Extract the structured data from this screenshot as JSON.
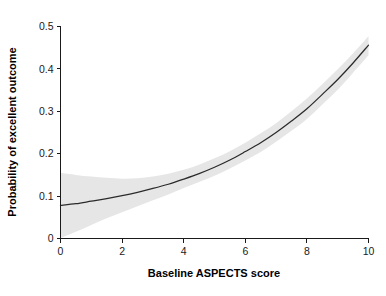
{
  "chart_data": {
    "type": "line",
    "title": "",
    "subtitle": "",
    "xlabel": "Baseline ASPECTS score",
    "ylabel": "Probability of excellent outcome",
    "xlim": [
      0,
      10
    ],
    "ylim": [
      0,
      0.5
    ],
    "xticks": [
      0,
      2,
      4,
      6,
      8,
      10
    ],
    "xtick_labels": [
      "0",
      "2",
      "4",
      "6",
      "8",
      "10"
    ],
    "yticks": [
      0,
      0.1,
      0.2,
      0.3,
      0.4,
      0.5
    ],
    "ytick_labels": [
      "0",
      "0.1",
      "0.2",
      "0.3",
      "0.4",
      "0.5"
    ],
    "grid": false,
    "legend": false,
    "legend_position": "none",
    "annotations": [],
    "x": [
      0,
      0.5,
      1,
      1.5,
      2,
      2.5,
      3,
      3.5,
      4,
      4.5,
      5,
      5.5,
      6,
      6.5,
      7,
      7.5,
      8,
      8.5,
      9,
      9.5,
      10
    ],
    "series": [
      {
        "name": "Predicted probability",
        "type": "line",
        "color": "#2b2b2b",
        "values": [
          0.078,
          0.082,
          0.088,
          0.094,
          0.101,
          0.109,
          0.118,
          0.128,
          0.14,
          0.153,
          0.168,
          0.185,
          0.205,
          0.226,
          0.25,
          0.277,
          0.306,
          0.34,
          0.375,
          0.414,
          0.456
        ]
      },
      {
        "name": "95% confidence interval (upper)",
        "type": "band-upper",
        "color": "#e6e6e6",
        "values": [
          0.155,
          0.15,
          0.146,
          0.143,
          0.141,
          0.142,
          0.146,
          0.153,
          0.162,
          0.174,
          0.189,
          0.206,
          0.226,
          0.248,
          0.272,
          0.3,
          0.33,
          0.364,
          0.399,
          0.437,
          0.477
        ]
      },
      {
        "name": "95% confidence interval (lower)",
        "type": "band-lower",
        "color": "#e6e6e6",
        "values": [
          0.001,
          0.016,
          0.032,
          0.048,
          0.062,
          0.076,
          0.09,
          0.104,
          0.119,
          0.133,
          0.148,
          0.165,
          0.184,
          0.204,
          0.228,
          0.254,
          0.282,
          0.316,
          0.351,
          0.391,
          0.432
        ]
      }
    ]
  },
  "axes": {
    "y_title": "Probability of excellent outcome",
    "x_title": "Baseline ASPECTS score",
    "y_tick_labels": [
      "0.5",
      "0.4",
      "0.3",
      "0.2",
      "0.1",
      "0"
    ],
    "x_tick_labels": [
      "0",
      "2",
      "4",
      "6",
      "8",
      "10"
    ]
  },
  "colors": {
    "background": "#ffffff",
    "axis": "#1a1a1a",
    "curve": "#2b2b2b",
    "confidence_band": "#e6e6e6",
    "text": "#000000"
  }
}
